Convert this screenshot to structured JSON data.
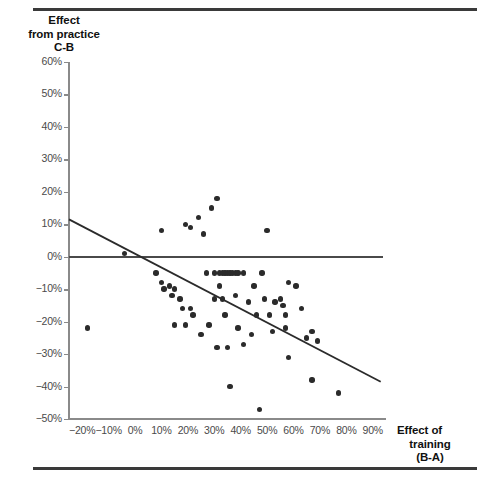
{
  "chart_data": {
    "type": "scatter",
    "title": "",
    "ylabel": "Effect from practice C-B",
    "ylabel_lines": [
      "Effect",
      "from practice",
      "C-B"
    ],
    "xlabel": "Effect of training (B-A)",
    "xlabel_lines": [
      "Effect of",
      "training",
      "(B-A)"
    ],
    "xlim": [
      -25,
      95
    ],
    "ylim": [
      -50,
      60
    ],
    "xticks": [
      -20,
      -10,
      0,
      10,
      20,
      30,
      40,
      50,
      60,
      70,
      80,
      90
    ],
    "xtick_labels": [
      "−20%",
      "−10%",
      "0%",
      "10%",
      "20%",
      "30%",
      "40%",
      "50%",
      "60%",
      "70%",
      "80%",
      "90%"
    ],
    "yticks": [
      60,
      50,
      40,
      30,
      20,
      10,
      0,
      -10,
      -20,
      -30,
      -40,
      -50
    ],
    "ytick_labels": [
      "60%",
      "50%",
      "40%",
      "30%",
      "20%",
      "10%",
      "0%",
      "−10%",
      "−20%",
      "−30%",
      "−40%",
      "−50%"
    ],
    "grid": false,
    "legend": null,
    "zero_reference_line": {
      "y": 0,
      "x_start": -25,
      "x_end": 94,
      "color": "#4a4a4a"
    },
    "trend_line": {
      "x_start": -25,
      "y_start": 11.5,
      "x_end": 93,
      "y_end": -38.5,
      "color": "#2b2b2b"
    },
    "point_color": "#2b2b2b",
    "points": [
      {
        "x": -18,
        "y": -22
      },
      {
        "x": -4,
        "y": 1
      },
      {
        "x": 8,
        "y": -5
      },
      {
        "x": 10,
        "y": 8
      },
      {
        "x": 10,
        "y": -8
      },
      {
        "x": 11,
        "y": -10
      },
      {
        "x": 13,
        "y": -9
      },
      {
        "x": 14,
        "y": -12
      },
      {
        "x": 15,
        "y": -10
      },
      {
        "x": 15,
        "y": -21
      },
      {
        "x": 17,
        "y": -13
      },
      {
        "x": 18,
        "y": -16
      },
      {
        "x": 19,
        "y": 10
      },
      {
        "x": 19,
        "y": -21
      },
      {
        "x": 21,
        "y": 9
      },
      {
        "x": 21,
        "y": -16
      },
      {
        "x": 22,
        "y": -18
      },
      {
        "x": 24,
        "y": 12
      },
      {
        "x": 25,
        "y": -24
      },
      {
        "x": 26,
        "y": 7
      },
      {
        "x": 27,
        "y": -5
      },
      {
        "x": 28,
        "y": -21
      },
      {
        "x": 29,
        "y": 15
      },
      {
        "x": 30,
        "y": -5
      },
      {
        "x": 30,
        "y": -13
      },
      {
        "x": 31,
        "y": -28
      },
      {
        "x": 31,
        "y": 18
      },
      {
        "x": 32,
        "y": -5
      },
      {
        "x": 32,
        "y": -9
      },
      {
        "x": 33,
        "y": -5
      },
      {
        "x": 33,
        "y": -13
      },
      {
        "x": 34,
        "y": -5
      },
      {
        "x": 34,
        "y": -18
      },
      {
        "x": 35,
        "y": -5
      },
      {
        "x": 35,
        "y": -28
      },
      {
        "x": 36,
        "y": -5
      },
      {
        "x": 36,
        "y": -40
      },
      {
        "x": 37,
        "y": -5
      },
      {
        "x": 38,
        "y": -5
      },
      {
        "x": 38,
        "y": -12
      },
      {
        "x": 39,
        "y": -5
      },
      {
        "x": 39,
        "y": -22
      },
      {
        "x": 41,
        "y": -5
      },
      {
        "x": 41,
        "y": -27
      },
      {
        "x": 43,
        "y": -14
      },
      {
        "x": 44,
        "y": -24
      },
      {
        "x": 45,
        "y": -9
      },
      {
        "x": 46,
        "y": -18
      },
      {
        "x": 47,
        "y": -47
      },
      {
        "x": 48,
        "y": -5
      },
      {
        "x": 49,
        "y": -13
      },
      {
        "x": 50,
        "y": 8
      },
      {
        "x": 51,
        "y": -18
      },
      {
        "x": 52,
        "y": -23
      },
      {
        "x": 53,
        "y": -14
      },
      {
        "x": 55,
        "y": -13
      },
      {
        "x": 56,
        "y": -15
      },
      {
        "x": 57,
        "y": -18
      },
      {
        "x": 57,
        "y": -22
      },
      {
        "x": 58,
        "y": -8
      },
      {
        "x": 58,
        "y": -31
      },
      {
        "x": 61,
        "y": -9
      },
      {
        "x": 63,
        "y": -16
      },
      {
        "x": 65,
        "y": -25
      },
      {
        "x": 67,
        "y": -23
      },
      {
        "x": 67,
        "y": -38
      },
      {
        "x": 69,
        "y": -26
      },
      {
        "x": 77,
        "y": -42
      }
    ]
  }
}
